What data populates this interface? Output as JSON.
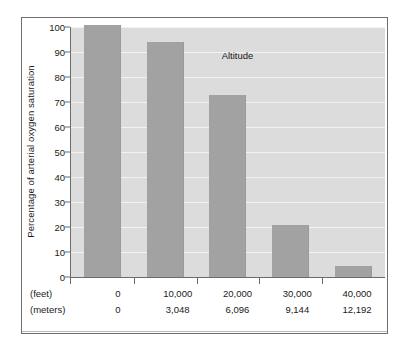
{
  "chart_data": {
    "type": "bar",
    "title": "",
    "xlabel": "Altitude",
    "ylabel": "Percentage of arterial oxygen saturation",
    "ylim": [
      0,
      100
    ],
    "yticks": [
      0,
      10,
      20,
      30,
      40,
      50,
      60,
      70,
      80,
      90,
      100
    ],
    "ytick_labels": [
      "0",
      "10",
      "20",
      "30",
      "40",
      "50",
      "60",
      "70",
      "80",
      "90",
      "100"
    ],
    "grid": true,
    "legend": "none",
    "bar_color": "#a2a2a2",
    "plot_background": "#dcdcdc",
    "gridline_color": "#f2f2f2",
    "categories": [
      "0",
      "10,000",
      "20,000",
      "30,000",
      "40,000"
    ],
    "values": [
      101,
      94,
      73,
      21,
      4.5
    ],
    "axis_rows": [
      {
        "header": "(feet)",
        "values": [
          "0",
          "10,000",
          "20,000",
          "30,000",
          "40,000"
        ]
      },
      {
        "header": "(meters)",
        "values": [
          "0",
          "3,048",
          "6,096",
          "9,144",
          "12,192"
        ]
      }
    ]
  }
}
